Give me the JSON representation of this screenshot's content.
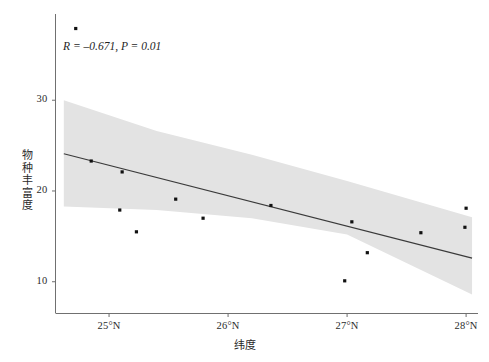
{
  "chart_data": {
    "type": "scatter",
    "title": "",
    "xlabel": "纬度",
    "ylabel": "物种丰富度",
    "xlim": [
      24.55,
      28.1
    ],
    "ylim": [
      6.5,
      39.5
    ],
    "grid": false,
    "legend_position": "none",
    "xticks": [
      25,
      26,
      27,
      28
    ],
    "xticklabels": [
      "25°N",
      "26°N",
      "27°N",
      "28°N"
    ],
    "yticks": [
      10,
      20,
      30
    ],
    "yticklabels": [
      "10",
      "20",
      "30"
    ],
    "annotation": "R = –0.671, P = 0.01",
    "correlation_r": -0.671,
    "p_value": 0.01,
    "points": [
      {
        "x": 24.72,
        "y": 37.9
      },
      {
        "x": 24.85,
        "y": 23.3
      },
      {
        "x": 25.11,
        "y": 22.1
      },
      {
        "x": 25.09,
        "y": 17.9
      },
      {
        "x": 25.23,
        "y": 15.5
      },
      {
        "x": 25.56,
        "y": 19.1
      },
      {
        "x": 25.79,
        "y": 17.0
      },
      {
        "x": 26.36,
        "y": 18.4
      },
      {
        "x": 27.04,
        "y": 16.6
      },
      {
        "x": 26.98,
        "y": 10.1
      },
      {
        "x": 27.17,
        "y": 13.2
      },
      {
        "x": 27.62,
        "y": 15.4
      },
      {
        "x": 28.0,
        "y": 18.1
      },
      {
        "x": 27.99,
        "y": 16.0
      }
    ],
    "regression_line": {
      "x_start": 24.62,
      "y_start": 24.1,
      "x_end": 28.05,
      "y_end": 12.6,
      "color": "#3a3a3a"
    },
    "confidence_band": {
      "color": "#e3e3e3",
      "upper": [
        {
          "x": 24.62,
          "y": 30.0
        },
        {
          "x": 25.4,
          "y": 26.6
        },
        {
          "x": 26.2,
          "y": 24.0
        },
        {
          "x": 27.0,
          "y": 21.1
        },
        {
          "x": 28.05,
          "y": 17.1
        }
      ],
      "lower": [
        {
          "x": 24.62,
          "y": 18.3
        },
        {
          "x": 25.4,
          "y": 17.9
        },
        {
          "x": 26.2,
          "y": 17.0
        },
        {
          "x": 27.0,
          "y": 15.2
        },
        {
          "x": 28.05,
          "y": 8.6
        }
      ]
    },
    "point_color": "#111111",
    "axis_color": "#6e6e6e"
  }
}
